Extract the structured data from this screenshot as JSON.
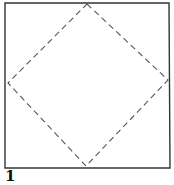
{
  "figure": {
    "label": "1",
    "outer_shape": "square",
    "inner_shape": "dashed-diamond",
    "colors": {
      "stroke": "#333333",
      "dash": "#555555",
      "background": "#ffffff"
    }
  }
}
